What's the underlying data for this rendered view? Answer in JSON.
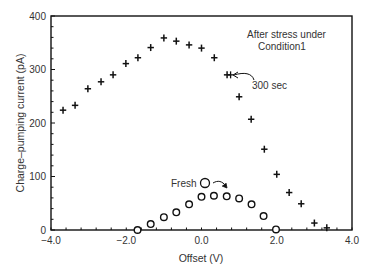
{
  "chart_data": {
    "type": "scatter",
    "title": "",
    "xlabel": "Offset (V)",
    "ylabel": "Charge–pumping current (pA)",
    "xlim": [
      -4.0,
      4.0
    ],
    "ylim": [
      0,
      400
    ],
    "xticks": [
      "−4.0",
      "−2.0",
      "0.0",
      "2.0",
      "4.0"
    ],
    "xtick_values": [
      -4.0,
      -2.0,
      0.0,
      2.0,
      4.0
    ],
    "yticks": [
      "0",
      "100",
      "200",
      "300",
      "400"
    ],
    "ytick_values": [
      0,
      100,
      200,
      300,
      400
    ],
    "grid": false,
    "series": [
      {
        "name": "300 sec",
        "marker": "plus",
        "x": [
          -3.68,
          -3.36,
          -3.02,
          -2.67,
          -2.35,
          -2.01,
          -1.69,
          -1.35,
          -1.0,
          -0.67,
          -0.33,
          0.0,
          0.34,
          0.68,
          1.0,
          1.32,
          1.67,
          2.0,
          2.33,
          2.65,
          3.0,
          3.33
        ],
        "y": [
          224,
          233,
          264,
          277,
          290,
          311,
          322,
          341,
          359,
          353,
          346,
          340,
          322,
          290,
          249,
          207,
          151,
          104,
          70,
          49,
          13,
          4
        ]
      },
      {
        "name": "Fresh",
        "marker": "circle",
        "x": [
          -1.7,
          -1.35,
          -1.0,
          -0.67,
          -0.33,
          0.0,
          0.33,
          0.67,
          1.0,
          1.33,
          1.65,
          1.98
        ],
        "y": [
          0,
          11,
          24,
          33,
          48,
          62,
          64,
          63,
          59,
          48,
          26,
          1
        ]
      }
    ],
    "annotations": [
      {
        "text": "After stress under",
        "line": 1
      },
      {
        "text": "Condition1",
        "line": 2
      },
      {
        "text": "300 sec",
        "points_to": "300 sec series"
      },
      {
        "text": "Fresh",
        "points_to": "Fresh series"
      }
    ],
    "legend": "none (inline annotations)"
  },
  "labels": {
    "xlabel": "Offset (V)",
    "ylabel": "Charge–pumping current (pA)",
    "annotation_line1": "After stress under",
    "annotation_line2": "Condition1",
    "stress_label": "300 sec",
    "fresh_label": "Fresh"
  }
}
